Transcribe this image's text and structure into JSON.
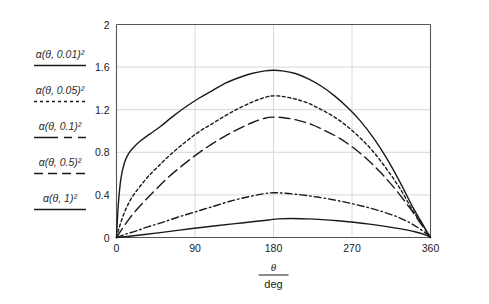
{
  "chart_data": {
    "type": "line",
    "title": "",
    "xlabel_numerator": "θ",
    "xlabel_denominator": "deg",
    "ylabel": "",
    "xlim": [
      0,
      360
    ],
    "ylim": [
      0,
      2
    ],
    "xticks": [
      "0",
      "90",
      "180",
      "270",
      "360"
    ],
    "xtick_values": [
      0,
      90,
      180,
      270,
      360
    ],
    "yticks": [
      "0",
      "0.4",
      "0.8",
      "1.2",
      "1.6",
      "2"
    ],
    "ytick_values": [
      0,
      0.4,
      0.8,
      1.2,
      1.6,
      2
    ],
    "grid": true,
    "grid_axis": "both",
    "legend_position": "left-outside",
    "line_color": "#1a1a1a",
    "grid_color": "#d8d8d8",
    "axis_color": "#555555",
    "series": [
      {
        "name": "α(θ, 0.01)²",
        "param": "0.01",
        "style": "solid",
        "peak_x": 180,
        "peak_y": 1.57,
        "x": [
          0,
          2,
          5,
          9,
          14,
          20,
          28,
          38,
          50,
          65,
          80,
          95,
          110,
          125,
          140,
          155,
          170,
          180,
          190,
          205,
          220,
          235,
          250,
          265,
          280,
          295,
          310,
          325,
          340,
          350,
          356,
          360
        ],
        "values": [
          0,
          0.3,
          0.55,
          0.7,
          0.79,
          0.85,
          0.91,
          0.97,
          1.04,
          1.14,
          1.23,
          1.31,
          1.38,
          1.45,
          1.5,
          1.54,
          1.565,
          1.57,
          1.565,
          1.54,
          1.49,
          1.42,
          1.33,
          1.22,
          1.09,
          0.93,
          0.74,
          0.52,
          0.28,
          0.14,
          0.05,
          0
        ]
      },
      {
        "name": "α(θ, 0.05)²",
        "param": "0.05",
        "style": "dotted",
        "peak_x": 180,
        "peak_y": 1.33,
        "x": [
          0,
          3,
          7,
          12,
          18,
          26,
          36,
          48,
          62,
          78,
          94,
          110,
          126,
          142,
          158,
          172,
          180,
          190,
          205,
          220,
          235,
          250,
          265,
          280,
          295,
          310,
          325,
          340,
          350,
          356,
          360
        ],
        "values": [
          0,
          0.09,
          0.19,
          0.29,
          0.38,
          0.47,
          0.57,
          0.67,
          0.78,
          0.89,
          0.99,
          1.07,
          1.15,
          1.22,
          1.28,
          1.32,
          1.33,
          1.325,
          1.3,
          1.26,
          1.2,
          1.13,
          1.04,
          0.93,
          0.8,
          0.64,
          0.46,
          0.25,
          0.13,
          0.05,
          0
        ]
      },
      {
        "name": "α(θ, 0.1)²",
        "param": "0.1",
        "style": "long-dash",
        "peak_x": 180,
        "peak_y": 1.13,
        "x": [
          0,
          4,
          9,
          15,
          23,
          33,
          45,
          60,
          76,
          92,
          108,
          124,
          140,
          156,
          170,
          180,
          192,
          208,
          224,
          240,
          256,
          272,
          288,
          304,
          320,
          336,
          348,
          356,
          360
        ],
        "values": [
          0,
          0.05,
          0.11,
          0.18,
          0.26,
          0.35,
          0.45,
          0.57,
          0.68,
          0.78,
          0.87,
          0.95,
          1.02,
          1.08,
          1.12,
          1.13,
          1.125,
          1.1,
          1.06,
          1.0,
          0.93,
          0.84,
          0.73,
          0.6,
          0.45,
          0.28,
          0.14,
          0.05,
          0
        ]
      },
      {
        "name": "α(θ, 0.5)²",
        "param": "0.5",
        "style": "dash-dot",
        "peak_x": 180,
        "peak_y": 0.42,
        "x": [
          0,
          10,
          22,
          36,
          52,
          70,
          90,
          110,
          130,
          150,
          168,
          180,
          194,
          212,
          230,
          248,
          266,
          284,
          302,
          320,
          336,
          348,
          356,
          360
        ],
        "values": [
          0,
          0.03,
          0.06,
          0.1,
          0.14,
          0.19,
          0.24,
          0.29,
          0.34,
          0.38,
          0.41,
          0.42,
          0.415,
          0.4,
          0.38,
          0.355,
          0.325,
          0.29,
          0.25,
          0.2,
          0.14,
          0.08,
          0.03,
          0
        ]
      },
      {
        "name": "α(θ, 1)²",
        "param": "1",
        "style": "solid",
        "peak_x": 185,
        "peak_y": 0.18,
        "x": [
          0,
          15,
          32,
          50,
          70,
          92,
          114,
          136,
          158,
          175,
          185,
          200,
          218,
          236,
          254,
          272,
          290,
          308,
          326,
          342,
          354,
          360
        ],
        "values": [
          0,
          0.012,
          0.028,
          0.046,
          0.067,
          0.089,
          0.11,
          0.13,
          0.15,
          0.165,
          0.175,
          0.178,
          0.175,
          0.168,
          0.157,
          0.143,
          0.126,
          0.105,
          0.081,
          0.054,
          0.025,
          0
        ]
      }
    ]
  },
  "legend": {
    "entries": [
      {
        "prefix": "α",
        "args": "(θ, 0.01)",
        "exp": "2",
        "style": "solid"
      },
      {
        "prefix": "α",
        "args": "(θ, 0.05)",
        "exp": "2",
        "style": "dotted"
      },
      {
        "prefix": "α",
        "args": "(θ, 0.1)",
        "exp": "2",
        "style": "long-dash"
      },
      {
        "prefix": "α",
        "args": "(θ, 0.5)",
        "exp": "2",
        "style": "dash-dot"
      },
      {
        "prefix": "α",
        "args": "(θ, 1)",
        "exp": "2",
        "style": "solid"
      }
    ]
  }
}
